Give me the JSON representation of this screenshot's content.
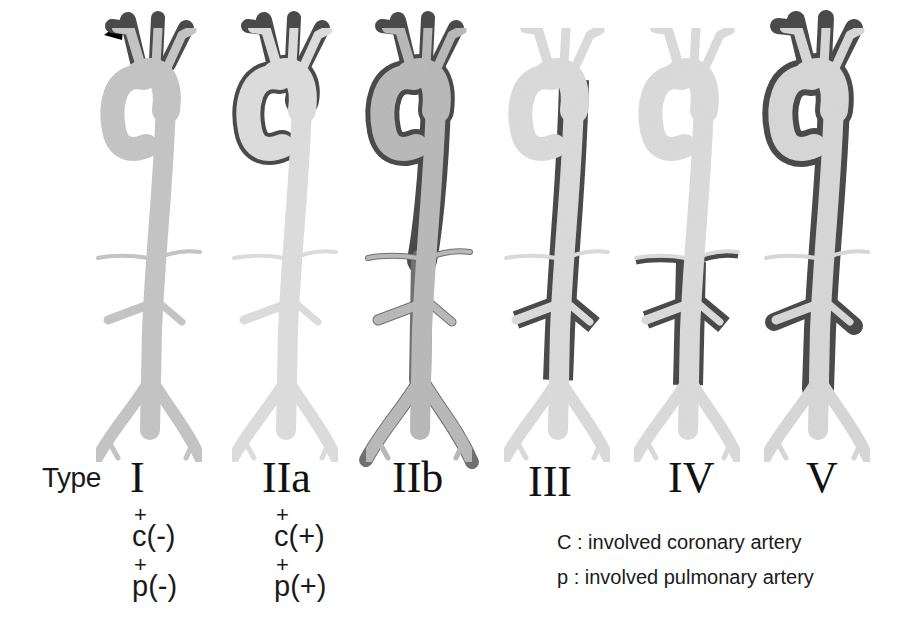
{
  "figure": {
    "type_label": "Type",
    "types": [
      {
        "id": "I",
        "label": "I",
        "sub_c": "c(-)",
        "sub_p": "p(-)",
        "plus": "+",
        "lumen_color": "#c4c4c4",
        "wall": "none"
      },
      {
        "id": "IIa",
        "label": "IIa",
        "sub_c": "c(+)",
        "sub_p": "p(+)",
        "plus": "+",
        "lumen_color": "#dedede",
        "wall": "arch-dark"
      },
      {
        "id": "IIb",
        "label": "IIb",
        "lumen_color": "#b8b8b8",
        "wall": "full-dark"
      },
      {
        "id": "III",
        "label": "III",
        "lumen_color": "#dcdcdc",
        "wall": "descending-dark"
      },
      {
        "id": "IV",
        "label": "IV",
        "lumen_color": "#dcdcdc",
        "wall": "abdominal-dark"
      },
      {
        "id": "V",
        "label": "V",
        "lumen_color": "#d8d8d8",
        "wall": "total-dark"
      }
    ],
    "legend": [
      {
        "key": "C",
        "text": "C : involved coronary artery"
      },
      {
        "key": "p",
        "text": "p : involved pulmonary artery"
      }
    ],
    "colors": {
      "false_lumen": "#4a4a4a",
      "background": "#ffffff",
      "text": "#1a1a1a"
    }
  }
}
